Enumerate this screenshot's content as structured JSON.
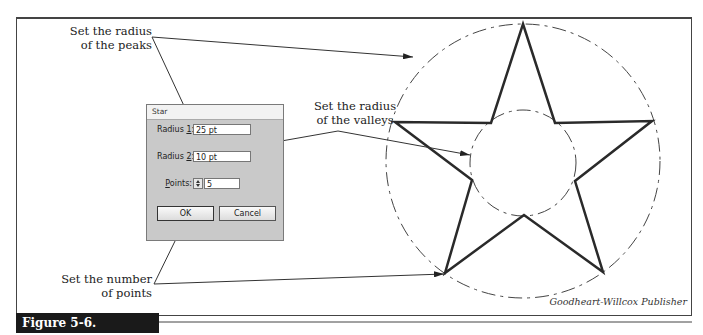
{
  "callouts": {
    "peaks": {
      "line1": "Set the radius",
      "line2": "of the peaks"
    },
    "valleys": {
      "line1": "Set the radius",
      "line2": "of the valleys"
    },
    "points": {
      "line1": "Set the number",
      "line2": "of points"
    }
  },
  "dialog": {
    "title": "Star",
    "radius1": {
      "label_pre": "Radius ",
      "label_key": "1",
      "label_post": ":",
      "value": "25 pt"
    },
    "radius2": {
      "label_pre": "Radius ",
      "label_key": "2",
      "label_post": ":",
      "value": "10 pt"
    },
    "points": {
      "label_key": "P",
      "label_post": "oints:",
      "value": "5",
      "spinner_icon": "up-down-arrows"
    },
    "ok_label": "OK",
    "cancel_label": "Cancel"
  },
  "credit": "Goodheart-Willcox Publisher",
  "figure_label": "Figure 5-6.",
  "star": {
    "points": 5,
    "outer_radius_px": 136,
    "inner_radius_px": 54,
    "center": [
      523,
      160
    ]
  },
  "colors": {
    "frame": "#444444",
    "dialog_bg": "#c9c9c9",
    "figure_label_bg": "#1a1a1a",
    "star_stroke": "#2a2a2a"
  }
}
